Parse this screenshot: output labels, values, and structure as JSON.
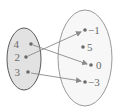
{
  "diagram": {
    "type": "function-mapping",
    "domain_set": {
      "label": "domain",
      "fill": "#e2e2e2",
      "stroke": "#5a5a5a",
      "elements": [
        "4",
        "2",
        "3"
      ]
    },
    "codomain_set": {
      "label": "range",
      "fill": "#f7f7f7",
      "stroke": "#8a8a8a",
      "elements": [
        "−1",
        "5",
        "0",
        "−3"
      ]
    },
    "mappings": [
      {
        "from": "2",
        "to": "−1"
      },
      {
        "from": "4",
        "to": "0"
      },
      {
        "from": "3",
        "to": "−3"
      }
    ],
    "colors": {
      "dot": "#6a6a6a",
      "arrow": "#8a8a8a",
      "text": "#6a6a6a"
    }
  }
}
